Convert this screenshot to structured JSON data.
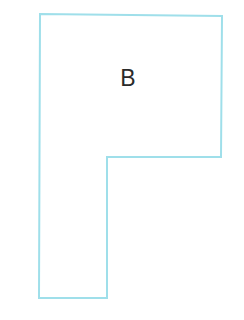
{
  "diagram": {
    "shape": {
      "type": "L-shaped polygon",
      "stroke_color": "#9fdfea",
      "fill_color": "#ffffff",
      "points": [
        [
          40,
          14
        ],
        [
          222,
          16
        ],
        [
          221,
          157
        ],
        [
          107,
          157
        ],
        [
          107,
          298
        ],
        [
          39,
          298
        ]
      ],
      "label": "B"
    }
  },
  "colors": {
    "outline": "#9fdfea",
    "label_text": "#2a2a2a",
    "background": "#ffffff"
  }
}
